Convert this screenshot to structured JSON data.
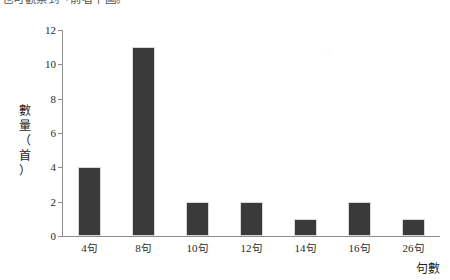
{
  "caption": {
    "text": "也可觀察到「前者下圖。"
  },
  "chart_data": {
    "type": "bar",
    "title": "",
    "subtitle": "",
    "categories": [
      "4句",
      "8句",
      "10句",
      "12句",
      "14句",
      "16句",
      "26句"
    ],
    "values": [
      4,
      11,
      2,
      2,
      1,
      2,
      1
    ],
    "series": [
      {
        "name": "數量（首）",
        "values": [
          4,
          11,
          2,
          2,
          1,
          2,
          1
        ]
      }
    ],
    "xlabel": "句數",
    "ylabel": "數量（首）",
    "ylim": [
      0,
      12
    ],
    "ytick_labels": [
      "0",
      "2",
      "4",
      "6",
      "8",
      "10",
      "12"
    ],
    "ytick_values": [
      0,
      2,
      4,
      6,
      8,
      10,
      12
    ],
    "grid": false,
    "legend": false,
    "bar_color": "#3a3a3a",
    "axis_color": "#8e8e8e",
    "background_color": "#ffffff"
  },
  "axis_titles": {
    "y_stacked": [
      "數",
      "量",
      "（",
      "首",
      "）"
    ],
    "x": "句數"
  }
}
